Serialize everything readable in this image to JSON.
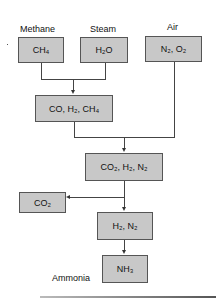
{
  "diagram": {
    "labels": {
      "methane": "Methane",
      "steam": "Steam",
      "air": "Air",
      "ammonia": "Ammonia"
    },
    "nodes": [
      {
        "id": "ch4",
        "parts": [
          "CH",
          "4",
          ""
        ]
      },
      {
        "id": "h2o",
        "parts": [
          "H",
          "2",
          "O"
        ]
      },
      {
        "id": "n2o2",
        "text": "N₂, O₂"
      },
      {
        "id": "co_h2_ch4",
        "text": "CO, H₂, CH₄"
      },
      {
        "id": "co2_h2_n2",
        "text": "CO₂, H₂, N₂"
      },
      {
        "id": "co2",
        "text": "CO₂"
      },
      {
        "id": "h2_n2",
        "text": "H₂, N₂"
      },
      {
        "id": "nh3",
        "text": "NH₃"
      }
    ],
    "edges": [
      [
        "ch4",
        "co_h2_ch4"
      ],
      [
        "h2o",
        "co_h2_ch4"
      ],
      [
        "co_h2_ch4",
        "co2_h2_n2"
      ],
      [
        "n2o2",
        "co2_h2_n2"
      ],
      [
        "co2_h2_n2",
        "co2"
      ],
      [
        "co2_h2_n2",
        "h2_n2"
      ],
      [
        "h2_n2",
        "nh3"
      ]
    ],
    "colors": {
      "box_fill": "#c8c8c8",
      "box_border": "#555555",
      "line": "#444444"
    }
  }
}
